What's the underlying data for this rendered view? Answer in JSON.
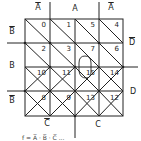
{
  "diagram": {
    "type": "karnaugh-map",
    "variables": [
      "A",
      "B",
      "C",
      "D"
    ],
    "top_labels": [
      {
        "text": "A",
        "overbar": true
      },
      {
        "text": "A",
        "overbar": false
      },
      {
        "text": "A",
        "overbar": true
      }
    ],
    "left_labels": [
      {
        "text": "B",
        "overbar": true
      },
      {
        "text": "B",
        "overbar": false
      },
      {
        "text": "B",
        "overbar": true
      }
    ],
    "right_labels": [
      {
        "text": "D",
        "overbar": true
      },
      {
        "text": "D",
        "overbar": false
      }
    ],
    "bottom_labels": [
      {
        "text": "C",
        "overbar": true
      },
      {
        "text": "C",
        "overbar": false
      }
    ],
    "cells": [
      [
        "0",
        "1",
        "5",
        "4"
      ],
      [
        "2",
        "3",
        "7",
        "6"
      ],
      [
        "10",
        "11",
        "15",
        "14"
      ],
      [
        "8",
        "9",
        "13",
        "12"
      ]
    ],
    "grouping": {
      "cells": [
        "11",
        "15"
      ],
      "shape": "loop"
    },
    "caption": "f = A̅ · B̅ · C̅ ..."
  }
}
